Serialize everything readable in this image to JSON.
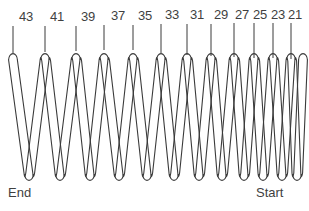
{
  "figure": {
    "background_color": "#ffffff",
    "line_color": "#3a3a3a",
    "text_color": "#3f3f3f"
  },
  "labels": {
    "end": "End",
    "start": "Start"
  },
  "coil_labels": [
    {
      "text": "43",
      "text_x": 26,
      "text_y": 10,
      "line_x": 13,
      "line_top": 26,
      "line_bottom": 53
    },
    {
      "text": "41",
      "text_x": 57,
      "text_y": 10,
      "line_x": 45,
      "line_top": 26,
      "line_bottom": 52
    },
    {
      "text": "39",
      "text_x": 88,
      "text_y": 10,
      "line_x": 76,
      "line_top": 26,
      "line_bottom": 51
    },
    {
      "text": "37",
      "text_x": 118,
      "text_y": 9,
      "line_x": 104,
      "line_top": 25,
      "line_bottom": 50
    },
    {
      "text": "35",
      "text_x": 145,
      "text_y": 9,
      "line_x": 133,
      "line_top": 25,
      "line_bottom": 50
    },
    {
      "text": "33",
      "text_x": 172,
      "text_y": 8,
      "line_x": 161,
      "line_top": 24,
      "line_bottom": 53
    },
    {
      "text": "31",
      "text_x": 197,
      "text_y": 8,
      "line_x": 187,
      "line_top": 24,
      "line_bottom": 55
    },
    {
      "text": "29",
      "text_x": 221,
      "text_y": 8,
      "line_x": 211,
      "line_top": 24,
      "line_bottom": 56
    },
    {
      "text": "27",
      "text_x": 242,
      "text_y": 8,
      "line_x": 234,
      "line_top": 23,
      "line_bottom": 57
    },
    {
      "text": "25",
      "text_x": 260,
      "text_y": 8,
      "line_x": 254,
      "line_top": 23,
      "line_bottom": 58
    },
    {
      "text": "23",
      "text_x": 278,
      "text_y": 8,
      "line_x": 273,
      "line_top": 23,
      "line_bottom": 58
    },
    {
      "text": "21",
      "text_x": 295,
      "text_y": 8,
      "line_x": 291,
      "line_top": 23,
      "line_bottom": 59
    }
  ],
  "spring": {
    "type": "helical-coil-outline",
    "coil_count": 13,
    "top_y": 54,
    "bottom_y": 180,
    "wire_half_width": 4.4,
    "peaks_x": [
      13,
      45,
      76,
      104,
      133,
      161,
      187,
      211,
      234,
      254,
      273,
      291,
      303
    ],
    "valleys_x": [
      29,
      60,
      90,
      119,
      147,
      174,
      199,
      222,
      244,
      263,
      282,
      297
    ]
  }
}
